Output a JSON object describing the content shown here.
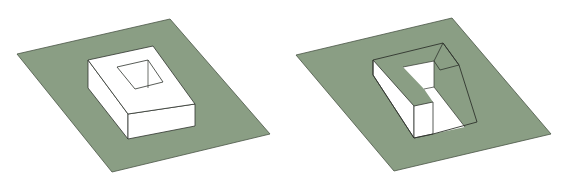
{
  "figure": {
    "colors": {
      "ground": "#8a9e84",
      "ground_edge": "#4a5646",
      "solid": "#ffffff",
      "line": "#2f332d",
      "background": "#ffffff"
    },
    "panels": [
      {
        "id": "left",
        "description": "Rectangular box with square hole in top, on green ground plane",
        "ground": [
          [
            17,
            54
          ],
          [
            170,
            19
          ],
          [
            270,
            134
          ],
          [
            112,
            172
          ]
        ],
        "box_top": [
          [
            88,
            60
          ],
          [
            153,
            46
          ],
          [
            195,
            104
          ],
          [
            128,
            114
          ]
        ],
        "box_left_face": [
          [
            88,
            60
          ],
          [
            128,
            114
          ],
          [
            128,
            139
          ],
          [
            88,
            88
          ]
        ],
        "box_front_face": [
          [
            128,
            114
          ],
          [
            195,
            104
          ],
          [
            195,
            126
          ],
          [
            128,
            139
          ]
        ],
        "hole": [
          [
            117,
            67
          ],
          [
            148,
            60
          ],
          [
            163,
            82
          ],
          [
            135,
            89
          ]
        ],
        "hole_inner_line": [
          [
            148,
            60
          ],
          [
            148,
            88
          ]
        ]
      },
      {
        "id": "right",
        "description": "U-shaped solid with sloped cut, on green ground plane",
        "ground": [
          [
            296,
            55
          ],
          [
            452,
            18
          ],
          [
            551,
            134
          ],
          [
            394,
            171
          ]
        ],
        "opening_outline": [
          [
            373,
            60
          ],
          [
            443,
            43
          ],
          [
            459,
            65
          ],
          [
            477,
            122
          ],
          [
            433,
            134
          ],
          [
            414,
            138
          ],
          [
            373,
            75
          ]
        ],
        "white_floor": [
          [
            403,
            67
          ],
          [
            434,
            61
          ],
          [
            434,
            87
          ],
          [
            465,
            127
          ],
          [
            433,
            134
          ],
          [
            433,
            102
          ],
          [
            424,
            89
          ]
        ],
        "left_arm_side": [
          [
            373,
            60
          ],
          [
            414,
            106
          ],
          [
            414,
            138
          ],
          [
            373,
            75
          ]
        ],
        "left_arm_front": [
          [
            414,
            106
          ],
          [
            433,
            102
          ],
          [
            433,
            134
          ],
          [
            414,
            138
          ]
        ],
        "right_arm_ledge": [
          [
            434,
            61
          ],
          [
            443,
            43
          ],
          [
            459,
            65
          ],
          [
            440,
            70
          ]
        ],
        "slope_line": [
          [
            434,
            87
          ],
          [
            465,
            127
          ]
        ]
      }
    ]
  }
}
